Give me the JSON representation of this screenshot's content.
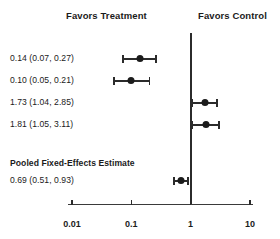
{
  "chart_data": {
    "type": "scatter",
    "plot_kind": "forest-plot",
    "title": "",
    "xlabel": "",
    "ylabel": "",
    "xscale": "log",
    "xlim": [
      0.01,
      10
    ],
    "xticks": [
      0.01,
      0.1,
      1,
      10
    ],
    "xtick_labels": [
      "0.01",
      "0.1",
      "1",
      "10"
    ],
    "grid": false,
    "reference_line": 1,
    "annotations": {
      "left_header": "Favors Treatment",
      "right_header": "Favors Control",
      "pooled_header": "Pooled Fixed-Effects Estimate"
    },
    "rows": [
      {
        "label": "0.14 (0.07, 0.27)",
        "estimate": 0.14,
        "ci_low": 0.07,
        "ci_high": 0.27,
        "pooled": false
      },
      {
        "label": "0.10 (0.05, 0.21)",
        "estimate": 0.1,
        "ci_low": 0.05,
        "ci_high": 0.21,
        "pooled": false
      },
      {
        "label": "1.73 (1.04, 2.85)",
        "estimate": 1.73,
        "ci_low": 1.04,
        "ci_high": 2.85,
        "pooled": false
      },
      {
        "label": "1.81 (1.05, 3.11)",
        "estimate": 1.81,
        "ci_low": 1.05,
        "ci_high": 3.11,
        "pooled": false
      },
      {
        "label": "0.69 (0.51, 0.93)",
        "estimate": 0.69,
        "ci_low": 0.51,
        "ci_high": 0.93,
        "pooled": true
      }
    ],
    "colors": {
      "marker": "#1b1b1b",
      "line": "#2b2b2b",
      "axis": "#3a3a3a",
      "text": "#1b1b1b",
      "background": "#ffffff"
    }
  },
  "layout": {
    "row_y": [
      58,
      80,
      102,
      124,
      180
    ],
    "pooled_title_y": 158,
    "x_of_001": 72,
    "px_per_decade": 59.3
  }
}
